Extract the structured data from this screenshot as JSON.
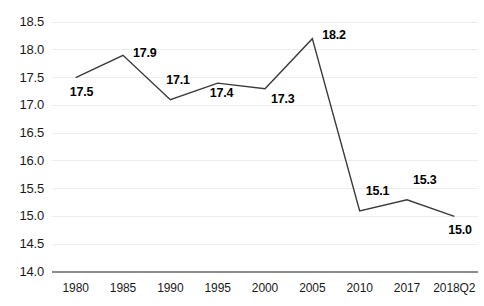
{
  "chart_data": {
    "type": "line",
    "title": "",
    "subtitle": "",
    "xlabel": "",
    "ylabel": "",
    "categories": [
      "1980",
      "1985",
      "1990",
      "1995",
      "2000",
      "2005",
      "2010",
      "2017",
      "2018Q2"
    ],
    "values": [
      17.5,
      17.9,
      17.1,
      17.4,
      17.3,
      18.2,
      15.1,
      15.3,
      15.0
    ],
    "data_labels": [
      "17.5",
      "17.9",
      "17.1",
      "17.4",
      "17.3",
      "18.2",
      "15.1",
      "15.3",
      "15.0"
    ],
    "ylim": [
      14.0,
      18.5
    ],
    "yticks": [
      14.0,
      14.5,
      15.0,
      15.5,
      16.0,
      16.5,
      17.0,
      17.5,
      18.0,
      18.5
    ],
    "ytick_labels": [
      "14.0",
      "14.5",
      "15.0",
      "15.5",
      "16.0",
      "16.5",
      "17.0",
      "17.5",
      "18.0",
      "18.5"
    ],
    "grid": true,
    "legend": [],
    "legend_position": "none",
    "series": [
      {
        "name": "series-1",
        "values": [
          17.5,
          17.9,
          17.1,
          17.4,
          17.3,
          18.2,
          15.1,
          15.3,
          15.0
        ],
        "color": "#3a3a3a"
      }
    ],
    "colors": {
      "line": "#3a3a3a",
      "grid": "#ededed",
      "axis": "#8c8c8c",
      "text": "#1a1a1a",
      "label": "#000000",
      "background": "#ffffff"
    },
    "label_offsets": [
      {
        "dx": -6,
        "dy": 14
      },
      {
        "dx": 10,
        "dy": -2
      },
      {
        "dx": -4,
        "dy": -20
      },
      {
        "dx": -8,
        "dy": 10
      },
      {
        "dx": 6,
        "dy": 10
      },
      {
        "dx": 10,
        "dy": -4
      },
      {
        "dx": 6,
        "dy": -20
      },
      {
        "dx": 6,
        "dy": -20
      },
      {
        "dx": -6,
        "dy": 14
      }
    ]
  }
}
